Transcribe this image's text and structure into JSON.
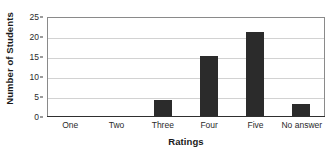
{
  "chart_data": {
    "type": "bar",
    "title": "",
    "categories": [
      "One",
      "Two",
      "Three",
      "Four",
      "Five",
      "No answer"
    ],
    "values": [
      0,
      0,
      4,
      15,
      21,
      3
    ],
    "xlabel": "Ratings",
    "ylabel": "Number of Students",
    "ylim": [
      0,
      25
    ],
    "yticks": [
      0,
      5,
      10,
      15,
      20,
      25
    ],
    "ytick_labels": [
      "0",
      "5",
      "10",
      "15",
      "20",
      "25"
    ],
    "grid": true,
    "grid_axis": "y",
    "legend": false,
    "bar_color": "#2b2b2b",
    "grid_color": "#d2d2d2",
    "frame_color": "#8a8a8a",
    "background_color": "#ffffff"
  }
}
